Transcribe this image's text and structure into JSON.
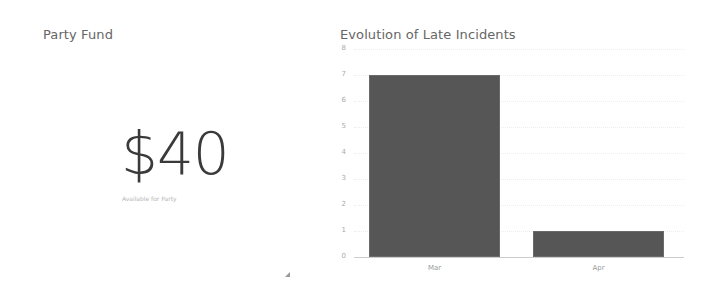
{
  "fund_panel": {
    "title": "Party Fund",
    "amount": "$40",
    "subtitle": "Available for Party"
  },
  "chart_panel": {
    "title": "Evolution of Late Incidents"
  },
  "chart_data": {
    "type": "bar",
    "title": "Evolution of Late Incidents",
    "categories": [
      "Mar",
      "Apr"
    ],
    "values": [
      7,
      1
    ],
    "xlabel": "",
    "ylabel": "",
    "ylim": [
      0,
      8
    ],
    "yticks": [
      "0",
      "1",
      "2",
      "3",
      "4",
      "5",
      "6",
      "7",
      "8"
    ],
    "grid": true,
    "bar_color": "#565656"
  },
  "icons": {
    "resize_handle": "resize-handle-icon"
  }
}
